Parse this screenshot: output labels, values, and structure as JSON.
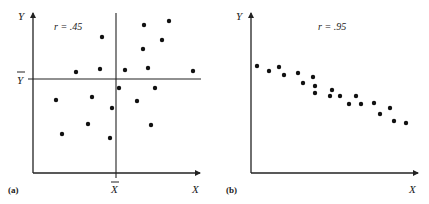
{
  "chart_data": [
    {
      "type": "scatter",
      "panel_label": "(a)",
      "annotation": "r = .45",
      "xlabel": "X",
      "ylabel": "Y",
      "mean_x_label": "X̄",
      "mean_y_label": "Ȳ",
      "grid": false,
      "reference_lines": [
        "vertical line at mean of X",
        "horizontal line at mean of Y"
      ],
      "points": [
        [
          144,
          25
        ],
        [
          169,
          21
        ],
        [
          102,
          37
        ],
        [
          162,
          40
        ],
        [
          143,
          49
        ],
        [
          76,
          72
        ],
        [
          100,
          69
        ],
        [
          125,
          70
        ],
        [
          148,
          68
        ],
        [
          193,
          71
        ],
        [
          119,
          88
        ],
        [
          155,
          88
        ],
        [
          56,
          100
        ],
        [
          92,
          97
        ],
        [
          137,
          101
        ],
        [
          112,
          108
        ],
        [
          88,
          124
        ],
        [
          151,
          125
        ],
        [
          62,
          134
        ],
        [
          110,
          138
        ]
      ],
      "points_note": "pixel coordinates (x,y) in the screenshot; no numeric axis ticks shown"
    },
    {
      "type": "scatter",
      "panel_label": "(b)",
      "annotation": "r = .95",
      "xlabel": "X",
      "ylabel": "Y",
      "grid": false,
      "points": [
        [
          257,
          66
        ],
        [
          269,
          71
        ],
        [
          279,
          67
        ],
        [
          284,
          75
        ],
        [
          298,
          73
        ],
        [
          303,
          83
        ],
        [
          313,
          77
        ],
        [
          315,
          86
        ],
        [
          315,
          93
        ],
        [
          330,
          96
        ],
        [
          332,
          90
        ],
        [
          340,
          96
        ],
        [
          349,
          104
        ],
        [
          356,
          96
        ],
        [
          361,
          104
        ],
        [
          374,
          103
        ],
        [
          380,
          114
        ],
        [
          390,
          108
        ],
        [
          394,
          121
        ],
        [
          406,
          123
        ]
      ],
      "points_note": "pixel coordinates (x,y) in the screenshot; no numeric axis ticks shown"
    }
  ],
  "panels": {
    "a": {
      "label": "(a)",
      "r": "r = .45",
      "x": "X",
      "y": "Y",
      "xbar": "X",
      "ybar": "Y"
    },
    "b": {
      "label": "(b)",
      "r": "r = .95",
      "x": "X",
      "y": "Y"
    }
  }
}
